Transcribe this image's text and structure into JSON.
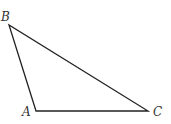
{
  "diagram": {
    "type": "triangle",
    "stroke_color": "#222222",
    "label_color": "#333333",
    "vertices": [
      {
        "name": "A",
        "x": 36,
        "y": 111
      },
      {
        "name": "B",
        "x": 9,
        "y": 25
      },
      {
        "name": "C",
        "x": 148,
        "y": 111
      }
    ],
    "labels": {
      "A": "A",
      "B": "B",
      "C": "C"
    }
  }
}
